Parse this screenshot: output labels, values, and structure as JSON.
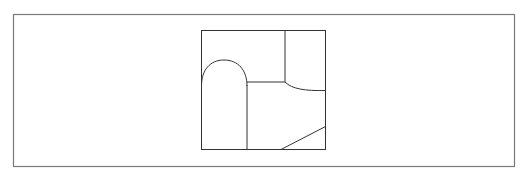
{
  "diagram": {
    "width": 530,
    "height": 179,
    "background": "#ffffff",
    "frame": {
      "x": 13.5,
      "y": 14.5,
      "w": 501,
      "h": 152,
      "stroke": "#7a7a7a",
      "stroke_width": 1.2
    },
    "square": {
      "x": 201.5,
      "y": 30.5,
      "w": 124,
      "h": 119,
      "stroke": "#333333",
      "stroke_width": 1
    },
    "line_color": "#333333",
    "paths": [
      {
        "name": "arch-shape",
        "d": "M201.5,86 C201.5,70 210,60 224,60 C238,60 247,70 247,86"
      },
      {
        "name": "left-divider-vertical",
        "d": "M247,85 L247,149.5"
      },
      {
        "name": "middle-horizontal-divider",
        "d": "M247,82 L285,82"
      },
      {
        "name": "upper-right-divider-vertical",
        "d": "M285,30.5 L285,82"
      },
      {
        "name": "right-concave-curve",
        "d": "M285,82 C292,89 305,91 325.5,90.5"
      },
      {
        "name": "bottom-right-diagonal",
        "d": "M281,149.5 L325.5,126.5"
      }
    ]
  }
}
